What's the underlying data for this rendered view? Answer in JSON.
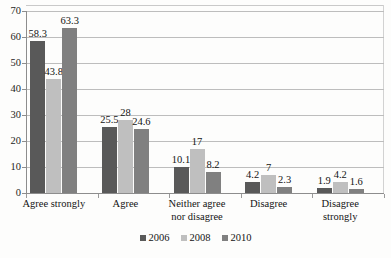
{
  "chart_data": {
    "type": "bar",
    "title": "",
    "subtitle": "",
    "xlabel": "",
    "ylabel": "",
    "ylim": [
      0,
      70
    ],
    "yticks": [
      0,
      10,
      20,
      30,
      40,
      50,
      60,
      70
    ],
    "grid": true,
    "legend_position": "bottom-center",
    "categories": [
      "Agree strongly",
      "Agree",
      "Neither agree nor disagree",
      "Disagree",
      "Disagree strongly"
    ],
    "category_lines": [
      [
        "Agree strongly"
      ],
      [
        "Agree"
      ],
      [
        "Neither agree",
        "nor disagree"
      ],
      [
        "Disagree"
      ],
      [
        "Disagree",
        "strongly"
      ]
    ],
    "series": [
      {
        "name": "2006",
        "color": "#595959",
        "values": [
          58.3,
          25.5,
          10.1,
          4.2,
          1.9
        ],
        "labels": [
          "58.3",
          "25.5",
          "10.1",
          "4.2",
          "1.9"
        ]
      },
      {
        "name": "2008",
        "color": "#bfbfbf",
        "values": [
          43.8,
          28,
          17,
          7,
          4.2
        ],
        "labels": [
          "43.8",
          "28",
          "17",
          "7",
          "4.2"
        ]
      },
      {
        "name": "2010",
        "color": "#808080",
        "values": [
          63.3,
          24.6,
          8.2,
          2.3,
          1.6
        ],
        "labels": [
          "63.3",
          "24.6",
          "8.2",
          "2.3",
          "1.6"
        ]
      }
    ]
  },
  "legend": {
    "items": [
      {
        "label": "2006",
        "color": "#595959"
      },
      {
        "label": "2008",
        "color": "#bfbfbf"
      },
      {
        "label": "2010",
        "color": "#808080"
      }
    ]
  },
  "axis": {
    "y_tick_labels": [
      "70",
      "60",
      "50",
      "40",
      "30",
      "20",
      "10",
      "0"
    ]
  }
}
